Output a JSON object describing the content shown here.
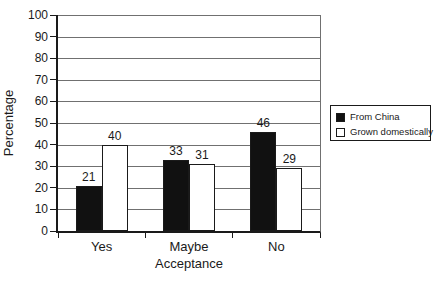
{
  "chart_data": {
    "type": "bar",
    "categories": [
      "Yes",
      "Maybe",
      "No"
    ],
    "series": [
      {
        "name": "From China",
        "color": "#111111",
        "values": [
          21,
          33,
          46
        ]
      },
      {
        "name": "Grown domestically",
        "color": "#ffffff",
        "values": [
          40,
          31,
          29
        ]
      }
    ],
    "title": "",
    "xlabel": "Acceptance",
    "ylabel": "Percentage",
    "ylim": [
      0,
      100
    ],
    "yticks": [
      0,
      10,
      20,
      30,
      40,
      50,
      60,
      70,
      80,
      90,
      100
    ],
    "grid": true,
    "value_labels": true,
    "legend_position": "right"
  },
  "colors": {
    "background": "#ffffff",
    "axis": "#1a1a1a",
    "gridline": "#707070",
    "bar_fill_series1": "#111111",
    "bar_fill_series2": "#ffffff",
    "legend_border": "#1a1a1a",
    "text": "#1a1a1a"
  }
}
